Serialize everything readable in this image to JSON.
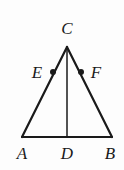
{
  "figure": {
    "type": "geometry-diagram",
    "background_color": "#fdfdfd",
    "stroke_color": "#1a1a1a",
    "stroke_width": 2,
    "points": {
      "A": {
        "x": 22,
        "y": 137,
        "label": "A",
        "label_x": 22,
        "label_y": 153
      },
      "B": {
        "x": 112,
        "y": 137,
        "label": "B",
        "label_x": 110,
        "label_y": 153
      },
      "C": {
        "x": 67,
        "y": 47,
        "label": "C",
        "label_x": 67,
        "label_y": 28
      },
      "D": {
        "x": 67,
        "y": 137,
        "label": "D",
        "label_x": 67,
        "label_y": 153
      },
      "E": {
        "x": 53,
        "y": 72,
        "label": "E",
        "label_x": 37,
        "label_y": 72
      },
      "F": {
        "x": 81,
        "y": 72,
        "label": "F",
        "label_x": 96,
        "label_y": 72
      }
    },
    "segments": [
      {
        "name": "side-AC",
        "from": "A",
        "to": "C"
      },
      {
        "name": "side-CB",
        "from": "C",
        "to": "B"
      },
      {
        "name": "base-AB",
        "from": "A",
        "to": "B"
      },
      {
        "name": "altitude-CD",
        "from": "C",
        "to": "D"
      }
    ],
    "markers": [
      {
        "name": "point-E-dot",
        "at": "E",
        "radius": 3
      },
      {
        "name": "point-F-dot",
        "at": "F",
        "radius": 3
      }
    ]
  }
}
